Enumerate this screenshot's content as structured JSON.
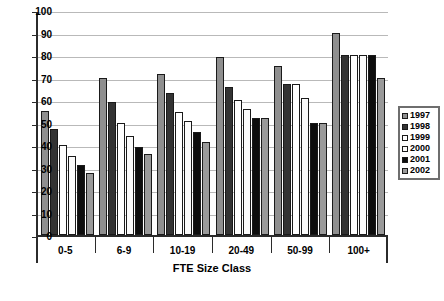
{
  "chart_data": {
    "type": "bar",
    "title": "",
    "xlabel": "FTE Size Class",
    "ylabel": "",
    "ylim": [
      0,
      100
    ],
    "ytick_step": 10,
    "yticks": [
      0,
      10,
      20,
      30,
      40,
      50,
      60,
      70,
      80,
      90,
      100
    ],
    "grid": true,
    "legend_position": "right",
    "categories": [
      "0-5",
      "6-9",
      "10-19",
      "20-49",
      "50-99",
      "100+"
    ],
    "series": [
      {
        "name": "1997",
        "color": "#8f8f8f",
        "values": [
          55,
          70,
          71.5,
          79,
          75,
          90
        ]
      },
      {
        "name": "1998",
        "color": "#333333",
        "values": [
          47,
          59,
          63,
          66,
          67,
          80
        ]
      },
      {
        "name": "1999",
        "color": "#ffffff",
        "values": [
          40,
          50,
          54.5,
          60,
          67,
          80
        ]
      },
      {
        "name": "2000",
        "color": "#fbfbfb",
        "values": [
          35,
          44,
          50.5,
          56,
          61,
          80
        ]
      },
      {
        "name": "2001",
        "color": "#0d0d0d",
        "values": [
          31,
          39,
          46,
          52,
          50,
          80
        ]
      },
      {
        "name": "2002",
        "color": "#9a9a9a",
        "values": [
          27.5,
          36,
          41.5,
          52,
          50,
          70
        ]
      }
    ]
  },
  "legend": {
    "entries": [
      {
        "label": "1997"
      },
      {
        "label": "1998"
      },
      {
        "label": "1999"
      },
      {
        "label": "2000"
      },
      {
        "label": "2001"
      },
      {
        "label": "2002"
      }
    ]
  }
}
